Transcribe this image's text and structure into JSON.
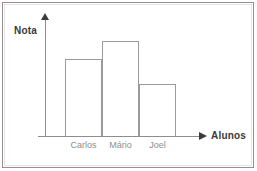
{
  "figure": {
    "frame_color": "#9d8b93",
    "background": "#ffffff"
  },
  "axes": {
    "y_title": "Nota",
    "x_title": "Alunos",
    "axis_color": "#8e8e8e",
    "arrow_color": "#3c3c3c",
    "y_arrow_icon": "arrow-up-icon",
    "x_arrow_icon": "arrow-right-icon"
  },
  "chart_data": {
    "type": "bar",
    "title": "",
    "subtitle": "",
    "xlabel": "Alunos",
    "ylabel": "Nota",
    "categories": [
      "Carlos",
      "Mário",
      "Joel"
    ],
    "values": [
      80,
      98,
      54
    ],
    "ylim": [
      0,
      123
    ],
    "grid": false,
    "legend": false,
    "bar_fill": "#ffffff",
    "bar_stroke": "#9a9a9a",
    "tick_label_color": "#8d8d8d",
    "axis_tick_labels_y": [],
    "annotations": []
  }
}
